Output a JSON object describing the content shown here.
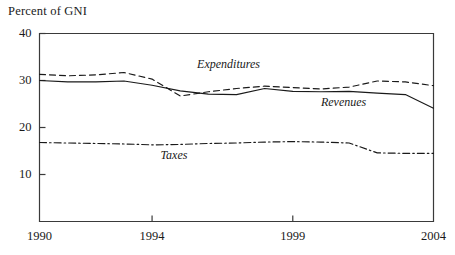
{
  "chart_data": {
    "type": "line",
    "title": "",
    "ylabel": "Percent of GNI",
    "xlabel": "",
    "xlim": [
      1990,
      2004
    ],
    "ylim": [
      0,
      40
    ],
    "yticks": [
      10,
      20,
      30,
      40
    ],
    "ytick_labels": [
      "10",
      "20",
      "30",
      "40"
    ],
    "xticks": [
      1990,
      1994,
      1999,
      2004
    ],
    "xtick_labels": [
      "1990",
      "1994",
      "1999",
      "2004"
    ],
    "grid": false,
    "legend_position": "inline-annotations",
    "x": [
      1990,
      1991,
      1992,
      1993,
      1994,
      1995,
      1996,
      1997,
      1998,
      1999,
      2000,
      2001,
      2002,
      2003,
      2004
    ],
    "series": [
      {
        "name": "Expenditures",
        "style": "dashed",
        "color": "#1a1a1a",
        "values": [
          31.3,
          31.0,
          31.2,
          31.7,
          30.3,
          26.7,
          27.6,
          28.3,
          28.8,
          28.5,
          28.2,
          28.6,
          29.9,
          29.7,
          28.9
        ]
      },
      {
        "name": "Revenues",
        "style": "solid",
        "color": "#1a1a1a",
        "values": [
          30.0,
          29.7,
          29.7,
          29.9,
          29.0,
          27.8,
          27.1,
          27.0,
          28.3,
          27.7,
          27.6,
          27.7,
          27.3,
          27.0,
          24.1
        ]
      },
      {
        "name": "Taxes",
        "style": "dashdot",
        "color": "#1a1a1a",
        "values": [
          16.8,
          16.7,
          16.6,
          16.5,
          16.3,
          16.4,
          16.6,
          16.7,
          16.9,
          17.0,
          16.9,
          16.7,
          14.6,
          14.5,
          14.5
        ]
      }
    ],
    "annotations": [
      {
        "text": "Expenditures",
        "x": 1995.6,
        "y": 33.4
      },
      {
        "text": "Revenues",
        "x": 2000.0,
        "y": 25.2
      },
      {
        "text": "Taxes",
        "x": 1994.3,
        "y": 14.0
      }
    ]
  },
  "axis": {
    "title": "Percent of GNI"
  }
}
